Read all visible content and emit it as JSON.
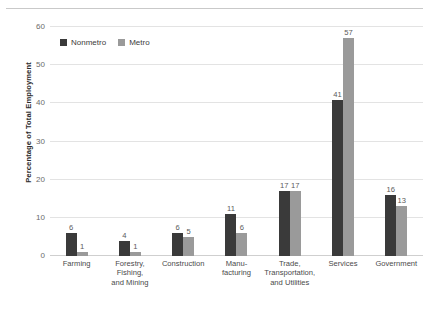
{
  "chart_data": {
    "type": "bar",
    "title": "",
    "xlabel": "",
    "ylabel": "Percentage of Total Employment",
    "ylim": [
      0,
      60
    ],
    "yticks": [
      0,
      10,
      20,
      30,
      40,
      50,
      60
    ],
    "grid": true,
    "legend_position": "top-left-inside",
    "categories": [
      "Farming",
      "Forestry, Fishing, and Mining",
      "Construction",
      "Manufacturing",
      "Trade, Transportation, and Utilities",
      "Services",
      "Government"
    ],
    "category_lines": [
      [
        "Farming"
      ],
      [
        "Forestry,",
        "Fishing,",
        "and Mining"
      ],
      [
        "Construction"
      ],
      [
        "Manu-",
        "facturing"
      ],
      [
        "Trade,",
        "Transportation,",
        "and Utilities"
      ],
      [
        "Services"
      ],
      [
        "Government"
      ]
    ],
    "series": [
      {
        "name": "Nonmetro",
        "color": "#3a3a3a",
        "values": [
          6,
          4,
          6,
          11,
          17,
          41,
          16
        ]
      },
      {
        "name": "Metro",
        "color": "#9a9a9a",
        "values": [
          1,
          1,
          5,
          6,
          17,
          57,
          13
        ]
      }
    ]
  },
  "colors": {
    "nonmetro": "#3a3a3a",
    "metro": "#9a9a9a",
    "gridline": "#e3e3e3",
    "baseline": "#cfcfcf",
    "top_rule": "#c9c9c9",
    "text": "#4a4a4a"
  }
}
